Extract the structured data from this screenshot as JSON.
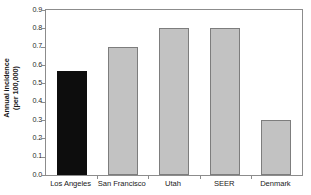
{
  "chart_data": {
    "type": "bar",
    "title": "",
    "subtitle": "",
    "xlabel": "",
    "ylabel": "Annual incidence (per 100,000)",
    "ylabel_lines": [
      "Annual incidence",
      "(per 100,000)"
    ],
    "categories": [
      "Los Angeles",
      "San Francisco",
      "Utah",
      "SEER",
      "Denmark"
    ],
    "values": [
      0.57,
      0.7,
      0.8,
      0.8,
      0.3
    ],
    "ylim": [
      0.0,
      0.9
    ],
    "ytick_values": [
      0.0,
      0.1,
      0.2,
      0.3,
      0.4,
      0.5,
      0.6,
      0.7,
      0.8,
      0.9
    ],
    "ytick_labels": [
      "0.0",
      "0.1",
      "0.2",
      "0.3",
      "0.4",
      "0.5",
      "0.6",
      "0.7",
      "0.8",
      "0.9"
    ],
    "grid": false,
    "legend": null,
    "bar_colors": [
      "#0d0d0d",
      "#c2c2c2",
      "#c2c2c2",
      "#c2c2c2",
      "#c2c2c2"
    ],
    "bar_edge_color": "#7d7d7d",
    "frame_color": "#8c8c8c",
    "background": "#ffffff",
    "highlight_category": "Los Angeles"
  }
}
